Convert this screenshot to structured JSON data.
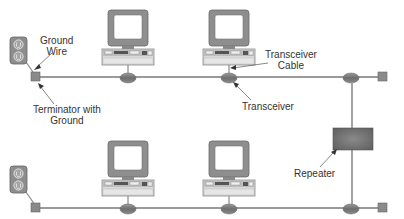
{
  "labels": {
    "ground_wire": [
      "Ground",
      "Wire"
    ],
    "terminator": [
      "Terminator with",
      "Ground"
    ],
    "transceiver_cable": [
      "Transceiver",
      "Cable"
    ],
    "transceiver": "Transceiver",
    "repeater": "Repeater"
  },
  "colors": {
    "cable": "#9a9a9a",
    "transceiver": "#7d7d7d",
    "repeater": "#6f6f6f",
    "outlet": "#8a8a8a",
    "monitor": "#8c8c8c",
    "text": "#333333"
  },
  "segments": [
    {
      "name": "upper-segment",
      "computers": 2,
      "transceivers": 3
    },
    {
      "name": "lower-segment",
      "computers": 2,
      "transceivers": 3
    }
  ]
}
